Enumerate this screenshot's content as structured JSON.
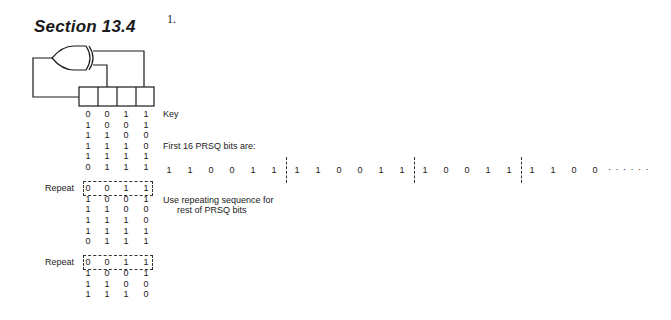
{
  "header": {
    "section_title": "Section 13.4",
    "problem_number": "1."
  },
  "circuit": {
    "gate": "XOR",
    "register_cells": 4,
    "taps": [
      2,
      4
    ]
  },
  "state_table": {
    "rows": [
      {
        "bits": [
          "0",
          "0",
          "1",
          "1"
        ],
        "label": "",
        "repeat": false
      },
      {
        "bits": [
          "1",
          "0",
          "0",
          "1"
        ],
        "label": "",
        "repeat": false
      },
      {
        "bits": [
          "1",
          "1",
          "0",
          "0"
        ],
        "label": "",
        "repeat": false
      },
      {
        "bits": [
          "1",
          "1",
          "1",
          "0"
        ],
        "label": "",
        "repeat": false
      },
      {
        "bits": [
          "1",
          "1",
          "1",
          "1"
        ],
        "label": "",
        "repeat": false
      },
      {
        "bits": [
          "0",
          "1",
          "1",
          "1"
        ],
        "label": "",
        "repeat": false
      },
      {
        "bits": [
          "0",
          "0",
          "1",
          "1"
        ],
        "label": "Repeat",
        "repeat": true
      },
      {
        "bits": [
          "1",
          "0",
          "0",
          "1"
        ],
        "label": "",
        "repeat": false
      },
      {
        "bits": [
          "1",
          "1",
          "0",
          "0"
        ],
        "label": "",
        "repeat": false
      },
      {
        "bits": [
          "1",
          "1",
          "1",
          "0"
        ],
        "label": "",
        "repeat": false
      },
      {
        "bits": [
          "1",
          "1",
          "1",
          "1"
        ],
        "label": "",
        "repeat": false
      },
      {
        "bits": [
          "0",
          "1",
          "1",
          "1"
        ],
        "label": "",
        "repeat": false
      },
      {
        "bits": [
          "0",
          "0",
          "1",
          "1"
        ],
        "label": "Repeat",
        "repeat": true
      },
      {
        "bits": [
          "1",
          "0",
          "0",
          "1"
        ],
        "label": "",
        "repeat": false
      },
      {
        "bits": [
          "1",
          "1",
          "0",
          "0"
        ],
        "label": "",
        "repeat": false
      },
      {
        "bits": [
          "1",
          "1",
          "1",
          "0"
        ],
        "label": "",
        "repeat": false
      }
    ]
  },
  "annotations": {
    "key_label": "Key",
    "first_bits_label": "First 16 PRSQ bits are:",
    "use_repeating_line1": "Use repeating sequence for",
    "use_repeating_line2": "rest of PRSQ bits",
    "ellipsis": "· · · · · ·"
  },
  "prsq_sequence": {
    "groups": [
      [
        "1",
        "1",
        "0",
        "0",
        "1",
        "1"
      ],
      [
        "1",
        "1",
        "0",
        "0",
        "1",
        "1"
      ],
      [
        "1",
        "0",
        "0",
        "1",
        "1"
      ],
      [
        "1",
        "1",
        "0",
        "0"
      ]
    ]
  }
}
